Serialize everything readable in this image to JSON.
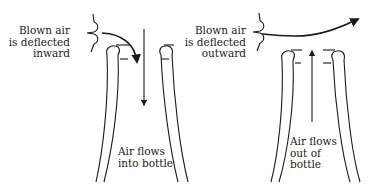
{
  "panels": [
    {
      "id": "inward",
      "blown_label": [
        "Blown air",
        "is deflected",
        "inward"
      ],
      "flow_label": [
        "Air flows",
        "into bottle"
      ]
    },
    {
      "id": "outward",
      "blown_label": [
        "Blown air",
        "is deflected",
        "outward"
      ],
      "flow_label": [
        "Air flows",
        "out of",
        "bottle"
      ]
    }
  ],
  "colors": {
    "ink": "#1a1a1a",
    "background": "#ffffff"
  }
}
